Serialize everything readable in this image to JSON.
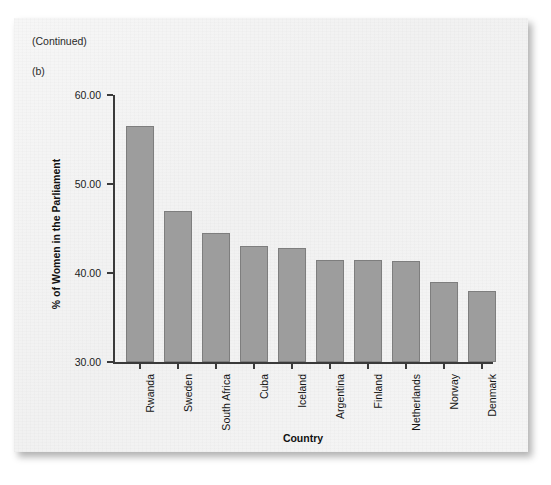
{
  "page": {
    "running_head": "AN INTRODUCTION TO STATISTICAL CONCEPTS",
    "continued_note": "(Continued)",
    "panel_letter": "(b)"
  },
  "chart_data": {
    "type": "bar",
    "title": "",
    "subtitle": "",
    "xlabel": "Country",
    "ylabel": "% of Women in the Parliament",
    "categories": [
      "Rwanda",
      "Sweden",
      "South Africa",
      "Cuba",
      "Iceland",
      "Argentina",
      "Finland",
      "Netherlands",
      "Norway",
      "Denmark"
    ],
    "values": [
      56.5,
      47.0,
      44.5,
      43.0,
      42.8,
      41.5,
      41.5,
      41.3,
      39.0,
      38.0
    ],
    "ylim": [
      30,
      60
    ],
    "ytick_labels": [
      "30.00",
      "40.00",
      "50.00",
      "60.00"
    ],
    "ytick_values": [
      30,
      40,
      50,
      60
    ],
    "grid": false,
    "legend": false,
    "bar_color": "#9d9d9d",
    "bar_edge_color": "#7e7e7e",
    "axis_color": "#3a3a3a",
    "panel_background": "#f3f3f3"
  }
}
